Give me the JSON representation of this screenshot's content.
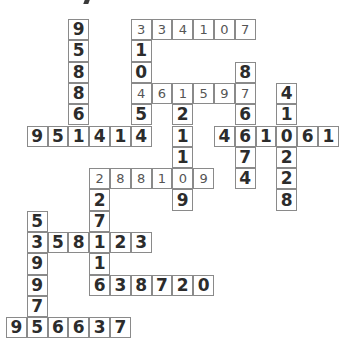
{
  "puzzle": {
    "type": "number-fill-in crossword",
    "grid": {
      "origin_x": 6,
      "origin_y": 19,
      "cell_w": 20.8,
      "cell_h": 21.3
    },
    "colors": {
      "border": "#8a8a8a",
      "bold_digit": "#2c2c2c",
      "light_digit": "#555555",
      "background": "#ffffff"
    },
    "entries": [
      {
        "id": "d-95886",
        "dir": "down",
        "row": 0,
        "col": 3,
        "digits": "958861",
        "style": "bold"
      },
      {
        "id": "a-334107",
        "dir": "across",
        "row": 0,
        "col": 6,
        "digits": "334107",
        "style": "light"
      },
      {
        "id": "d-310454",
        "dir": "down",
        "row": 0,
        "col": 6,
        "digits": "310454",
        "style": "bold"
      },
      {
        "id": "d-876674",
        "dir": "down",
        "row": 2,
        "col": 11,
        "digits": "876674",
        "style": "bold"
      },
      {
        "id": "a-461597",
        "dir": "across",
        "row": 3,
        "col": 6,
        "digits": "461597",
        "style": "light"
      },
      {
        "id": "d-410228",
        "dir": "down",
        "row": 3,
        "col": 13,
        "digits": "410228",
        "style": "bold"
      },
      {
        "id": "d-121109",
        "dir": "down",
        "row": 3,
        "col": 8,
        "digits": "121109",
        "style": "bold"
      },
      {
        "id": "a-951414",
        "dir": "across",
        "row": 5,
        "col": 1,
        "digits": "951414",
        "style": "bold"
      },
      {
        "id": "a-461061",
        "dir": "across",
        "row": 5,
        "col": 10,
        "digits": "461061",
        "style": "bold"
      },
      {
        "id": "a-288109",
        "dir": "across",
        "row": 7,
        "col": 4,
        "digits": "288109",
        "style": "light"
      },
      {
        "id": "d-227116",
        "dir": "down",
        "row": 7,
        "col": 4,
        "digits": "227116",
        "style": "bold"
      },
      {
        "id": "d-539975",
        "dir": "down",
        "row": 9,
        "col": 1,
        "digits": "539975",
        "style": "bold"
      },
      {
        "id": "a-358123",
        "dir": "across",
        "row": 10,
        "col": 1,
        "digits": "358123",
        "style": "bold"
      },
      {
        "id": "a-638720",
        "dir": "across",
        "row": 12,
        "col": 4,
        "digits": "638720",
        "style": "bold"
      },
      {
        "id": "a-956637",
        "dir": "across",
        "row": 14,
        "col": 0,
        "digits": "956637",
        "style": "bold"
      }
    ],
    "cells": [
      {
        "r": 0,
        "c": 3,
        "v": "9",
        "s": "bold"
      },
      {
        "r": 1,
        "c": 3,
        "v": "5",
        "s": "bold"
      },
      {
        "r": 2,
        "c": 3,
        "v": "8",
        "s": "bold"
      },
      {
        "r": 3,
        "c": 3,
        "v": "8",
        "s": "bold"
      },
      {
        "r": 4,
        "c": 3,
        "v": "6",
        "s": "bold"
      },
      {
        "r": 0,
        "c": 6,
        "v": "3",
        "s": "light"
      },
      {
        "r": 0,
        "c": 7,
        "v": "3",
        "s": "light"
      },
      {
        "r": 0,
        "c": 8,
        "v": "4",
        "s": "light"
      },
      {
        "r": 0,
        "c": 9,
        "v": "1",
        "s": "light"
      },
      {
        "r": 0,
        "c": 10,
        "v": "0",
        "s": "light"
      },
      {
        "r": 0,
        "c": 11,
        "v": "7",
        "s": "light"
      },
      {
        "r": 1,
        "c": 6,
        "v": "1",
        "s": "bold"
      },
      {
        "r": 2,
        "c": 6,
        "v": "0",
        "s": "bold"
      },
      {
        "r": 4,
        "c": 6,
        "v": "5",
        "s": "bold"
      },
      {
        "r": 2,
        "c": 11,
        "v": "8",
        "s": "bold"
      },
      {
        "r": 3,
        "c": 6,
        "v": "4",
        "s": "light"
      },
      {
        "r": 3,
        "c": 7,
        "v": "6",
        "s": "light"
      },
      {
        "r": 3,
        "c": 8,
        "v": "1",
        "s": "light"
      },
      {
        "r": 3,
        "c": 9,
        "v": "5",
        "s": "light"
      },
      {
        "r": 3,
        "c": 10,
        "v": "9",
        "s": "light"
      },
      {
        "r": 3,
        "c": 11,
        "v": "7",
        "s": "light"
      },
      {
        "r": 3,
        "c": 13,
        "v": "4",
        "s": "bold"
      },
      {
        "r": 4,
        "c": 13,
        "v": "1",
        "s": "bold"
      },
      {
        "r": 4,
        "c": 8,
        "v": "2",
        "s": "bold"
      },
      {
        "r": 4,
        "c": 11,
        "v": "6",
        "s": "bold"
      },
      {
        "r": 5,
        "c": 1,
        "v": "9",
        "s": "bold"
      },
      {
        "r": 5,
        "c": 2,
        "v": "5",
        "s": "bold"
      },
      {
        "r": 5,
        "c": 3,
        "v": "1",
        "s": "bold"
      },
      {
        "r": 5,
        "c": 4,
        "v": "4",
        "s": "bold"
      },
      {
        "r": 5,
        "c": 5,
        "v": "1",
        "s": "bold"
      },
      {
        "r": 5,
        "c": 6,
        "v": "4",
        "s": "bold"
      },
      {
        "r": 5,
        "c": 8,
        "v": "1",
        "s": "bold"
      },
      {
        "r": 5,
        "c": 10,
        "v": "4",
        "s": "bold"
      },
      {
        "r": 5,
        "c": 11,
        "v": "6",
        "s": "bold"
      },
      {
        "r": 5,
        "c": 12,
        "v": "1",
        "s": "bold"
      },
      {
        "r": 5,
        "c": 13,
        "v": "0",
        "s": "bold"
      },
      {
        "r": 5,
        "c": 14,
        "v": "6",
        "s": "bold"
      },
      {
        "r": 5,
        "c": 15,
        "v": "1",
        "s": "bold"
      },
      {
        "r": 6,
        "c": 8,
        "v": "1",
        "s": "bold"
      },
      {
        "r": 6,
        "c": 11,
        "v": "7",
        "s": "bold"
      },
      {
        "r": 6,
        "c": 13,
        "v": "2",
        "s": "bold"
      },
      {
        "r": 7,
        "c": 4,
        "v": "2",
        "s": "light"
      },
      {
        "r": 7,
        "c": 5,
        "v": "8",
        "s": "light"
      },
      {
        "r": 7,
        "c": 6,
        "v": "8",
        "s": "light"
      },
      {
        "r": 7,
        "c": 7,
        "v": "1",
        "s": "light"
      },
      {
        "r": 7,
        "c": 8,
        "v": "0",
        "s": "light"
      },
      {
        "r": 7,
        "c": 9,
        "v": "9",
        "s": "light"
      },
      {
        "r": 7,
        "c": 11,
        "v": "4",
        "s": "bold"
      },
      {
        "r": 7,
        "c": 13,
        "v": "2",
        "s": "bold"
      },
      {
        "r": 8,
        "c": 4,
        "v": "2",
        "s": "bold"
      },
      {
        "r": 8,
        "c": 8,
        "v": "9",
        "s": "bold"
      },
      {
        "r": 8,
        "c": 13,
        "v": "8",
        "s": "bold"
      },
      {
        "r": 9,
        "c": 1,
        "v": "5",
        "s": "bold"
      },
      {
        "r": 9,
        "c": 4,
        "v": "7",
        "s": "bold"
      },
      {
        "r": 10,
        "c": 1,
        "v": "3",
        "s": "bold"
      },
      {
        "r": 10,
        "c": 2,
        "v": "5",
        "s": "bold"
      },
      {
        "r": 10,
        "c": 3,
        "v": "8",
        "s": "bold"
      },
      {
        "r": 10,
        "c": 4,
        "v": "1",
        "s": "bold"
      },
      {
        "r": 10,
        "c": 5,
        "v": "2",
        "s": "bold"
      },
      {
        "r": 10,
        "c": 6,
        "v": "3",
        "s": "bold"
      },
      {
        "r": 11,
        "c": 1,
        "v": "9",
        "s": "bold"
      },
      {
        "r": 11,
        "c": 4,
        "v": "1",
        "s": "bold"
      },
      {
        "r": 12,
        "c": 1,
        "v": "9",
        "s": "bold"
      },
      {
        "r": 12,
        "c": 4,
        "v": "6",
        "s": "bold"
      },
      {
        "r": 12,
        "c": 5,
        "v": "3",
        "s": "bold"
      },
      {
        "r": 12,
        "c": 6,
        "v": "8",
        "s": "bold"
      },
      {
        "r": 12,
        "c": 7,
        "v": "7",
        "s": "bold"
      },
      {
        "r": 12,
        "c": 8,
        "v": "2",
        "s": "bold"
      },
      {
        "r": 12,
        "c": 9,
        "v": "0",
        "s": "bold"
      },
      {
        "r": 13,
        "c": 1,
        "v": "7",
        "s": "bold"
      },
      {
        "r": 14,
        "c": 0,
        "v": "9",
        "s": "bold"
      },
      {
        "r": 14,
        "c": 1,
        "v": "5",
        "s": "bold"
      },
      {
        "r": 14,
        "c": 2,
        "v": "6",
        "s": "bold"
      },
      {
        "r": 14,
        "c": 3,
        "v": "6",
        "s": "bold"
      },
      {
        "r": 14,
        "c": 4,
        "v": "3",
        "s": "bold"
      },
      {
        "r": 14,
        "c": 5,
        "v": "7",
        "s": "bold"
      }
    ]
  }
}
